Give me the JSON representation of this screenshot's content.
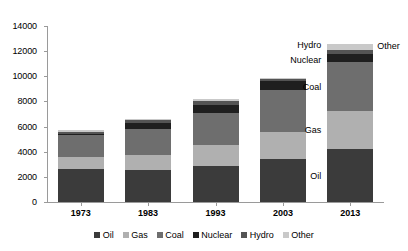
{
  "chart_data": {
    "type": "bar",
    "subtype": "stacked-bar",
    "title": "",
    "xlabel": "",
    "ylabel": "",
    "categories": [
      "1973",
      "1983",
      "1993",
      "2003",
      "2013"
    ],
    "ylim": [
      0,
      14000
    ],
    "yticks": [
      0,
      2000,
      4000,
      6000,
      8000,
      10000,
      12000,
      14000
    ],
    "ytick_labels": [
      "0",
      "2000",
      "4000",
      "6000",
      "8000",
      "10000",
      "12000",
      "14000"
    ],
    "grid": false,
    "legend_position": "bottom",
    "series": [
      {
        "name": "Oil",
        "color": "#3b3b3b",
        "values": [
          2650,
          2550,
          2900,
          3450,
          4200
        ]
      },
      {
        "name": "Gas",
        "color": "#b0b0b0",
        "values": [
          950,
          1150,
          1650,
          2150,
          3000
        ]
      },
      {
        "name": "Coal",
        "color": "#6e6e6e",
        "values": [
          1750,
          2100,
          2500,
          3300,
          3900
        ]
      },
      {
        "name": "Nuclear",
        "color": "#1f1f1f",
        "values": [
          60,
          500,
          700,
          700,
          650
        ]
      },
      {
        "name": "Hydro",
        "color": "#545454",
        "values": [
          180,
          200,
          250,
          200,
          350
        ]
      },
      {
        "name": "Other",
        "color": "#c9c9c9",
        "values": [
          110,
          100,
          200,
          100,
          500
        ]
      }
    ],
    "totals": [
      5700,
      6600,
      8200,
      9900,
      12600
    ],
    "annotations": [
      {
        "text": "Oil",
        "series": "Oil",
        "category": "2013",
        "side": "left"
      },
      {
        "text": "Gas",
        "series": "Gas",
        "category": "2013",
        "side": "left"
      },
      {
        "text": "Coal",
        "series": "Coal",
        "category": "2013",
        "side": "left"
      },
      {
        "text": "Nuclear",
        "series": "Nuclear",
        "category": "2013",
        "side": "left"
      },
      {
        "text": "Hydro",
        "series": "Hydro",
        "category": "2013",
        "side": "left"
      },
      {
        "text": "Other",
        "series": "Other",
        "category": "2013",
        "side": "right"
      }
    ]
  },
  "legend": {
    "items": [
      {
        "label": "Oil",
        "color": "#3b3b3b"
      },
      {
        "label": "Gas",
        "color": "#b0b0b0"
      },
      {
        "label": "Coal",
        "color": "#6e6e6e"
      },
      {
        "label": "Nuclear",
        "color": "#1f1f1f"
      },
      {
        "label": "Hydro",
        "color": "#545454"
      },
      {
        "label": "Other",
        "color": "#c9c9c9"
      }
    ]
  },
  "axis": {
    "line_color": "#9a9a9a"
  }
}
